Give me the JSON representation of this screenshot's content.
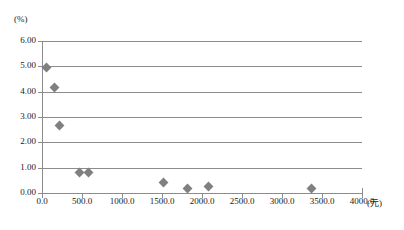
{
  "chart_data": {
    "type": "scatter",
    "title": "",
    "xlabel": "(元)",
    "ylabel": "(%)",
    "xlim": [
      0,
      4000
    ],
    "ylim": [
      0,
      6
    ],
    "grid": true,
    "legend": false,
    "x_tick_labels": [
      "0.0",
      "500.0",
      "1000.0",
      "1500.0",
      "2000.0",
      "2500.0",
      "3000.0",
      "3500.0",
      "4000.0"
    ],
    "x_tick_values": [
      0,
      500,
      1000,
      1500,
      2000,
      2500,
      3000,
      3500,
      4000
    ],
    "y_tick_labels": [
      "0.00",
      "1.00",
      "2.00",
      "3.00",
      "4.00",
      "5.00",
      "6.00"
    ],
    "y_tick_values": [
      0,
      1,
      2,
      3,
      4,
      5,
      6
    ],
    "marker": "diamond",
    "marker_color": "#808080",
    "grid_color": "#8c8c8c",
    "series": [
      {
        "name": "",
        "points": [
          {
            "x": 60,
            "y": 4.95
          },
          {
            "x": 150,
            "y": 4.15
          },
          {
            "x": 220,
            "y": 2.67
          },
          {
            "x": 470,
            "y": 0.79
          },
          {
            "x": 580,
            "y": 0.81
          },
          {
            "x": 1520,
            "y": 0.4
          },
          {
            "x": 1820,
            "y": 0.18
          },
          {
            "x": 2080,
            "y": 0.25
          },
          {
            "x": 3370,
            "y": 0.17
          }
        ]
      }
    ]
  }
}
